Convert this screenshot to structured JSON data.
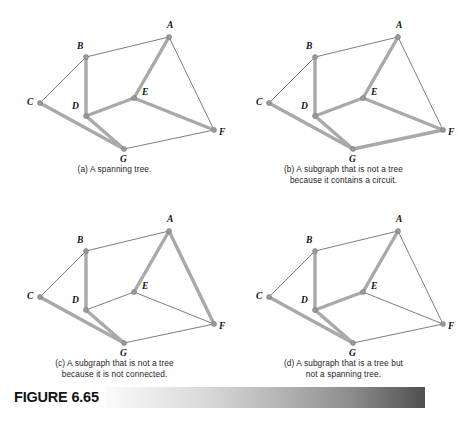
{
  "figure": {
    "label": "FIGURE 6.65",
    "accent_dark": "#4f4f4f",
    "accent_light": "#fbfbfb"
  },
  "graph": {
    "nodes": [
      {
        "id": "A",
        "label": "A",
        "x": 169,
        "y": 33,
        "lx": 167,
        "ly": 24
      },
      {
        "id": "B",
        "label": "B",
        "x": 86,
        "y": 53,
        "lx": 77,
        "ly": 45
      },
      {
        "id": "C",
        "label": "C",
        "x": 40,
        "y": 99,
        "lx": 27,
        "ly": 101
      },
      {
        "id": "D",
        "label": "D",
        "x": 86,
        "y": 112,
        "lx": 72,
        "ly": 105
      },
      {
        "id": "E",
        "label": "E",
        "x": 134,
        "y": 94,
        "lx": 142,
        "ly": 91
      },
      {
        "id": "F",
        "label": "F",
        "x": 214,
        "y": 126,
        "lx": 219,
        "ly": 131
      },
      {
        "id": "G",
        "label": "G",
        "x": 124,
        "y": 145,
        "lx": 120,
        "ly": 158
      }
    ],
    "edges": [
      {
        "id": "AB",
        "from": "A",
        "to": "B"
      },
      {
        "id": "AE",
        "from": "A",
        "to": "E"
      },
      {
        "id": "AF",
        "from": "A",
        "to": "F"
      },
      {
        "id": "BC",
        "from": "B",
        "to": "C"
      },
      {
        "id": "BD",
        "from": "B",
        "to": "D"
      },
      {
        "id": "CG",
        "from": "C",
        "to": "G"
      },
      {
        "id": "DE",
        "from": "D",
        "to": "E"
      },
      {
        "id": "DG",
        "from": "D",
        "to": "G"
      },
      {
        "id": "EF",
        "from": "E",
        "to": "F"
      },
      {
        "id": "GF",
        "from": "G",
        "to": "F"
      }
    ],
    "edge_styles": {
      "thin_color": "#6e6e6e",
      "thick_color": "#a9a9a9",
      "node_color": "#9a9a9a"
    }
  },
  "panels": [
    {
      "key": "a",
      "caption": "(a) A spanning tree.",
      "caption_lines": [
        "(a) A spanning tree."
      ],
      "highlighted_edges": [
        "BD",
        "AE",
        "CG",
        "DE",
        "DG",
        "EF"
      ]
    },
    {
      "key": "b",
      "caption": "(b) A subgraph that is not a tree because it contains a circuit.",
      "caption_lines": [
        "(b) A subgraph that is not a tree",
        "because it contains a circuit."
      ],
      "highlighted_edges": [
        "BD",
        "AE",
        "CG",
        "DE",
        "DG",
        "EF",
        "GF"
      ]
    },
    {
      "key": "c",
      "caption": "(c) A subgraph that is not a tree because it is not connected.",
      "caption_lines": [
        "(c) A subgraph that is not a tree",
        "because it is not connected."
      ],
      "highlighted_edges": [
        "AE",
        "AF",
        "BD",
        "CG",
        "DG"
      ]
    },
    {
      "key": "d",
      "caption": "(d) A subgraph that is a tree but not a spanning tree.",
      "caption_lines": [
        "(d) A subgraph that is a tree but",
        "not a spanning tree."
      ],
      "highlighted_edges": [
        "AE",
        "BD",
        "CG",
        "DE",
        "DG"
      ]
    }
  ]
}
